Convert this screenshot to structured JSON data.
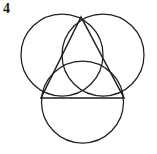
{
  "figure": {
    "label": "4",
    "background_color": "#ffffff",
    "stroke_color": "#1e1e1e",
    "canvas": {
      "width": 157,
      "height": 154
    },
    "circles": [
      {
        "name": "upper-left-circle",
        "cx": 62,
        "cy": 55,
        "r": 41
      },
      {
        "name": "upper-right-circle",
        "cx": 103,
        "cy": 55,
        "r": 41
      },
      {
        "name": "lower-circle",
        "cx": 82.5,
        "cy": 102,
        "r": 41
      }
    ],
    "triangle": {
      "name": "inscribed-triangle",
      "points": "81,17 41,98 124,98",
      "vertices": [
        {
          "name": "apex-vertex",
          "x": 81,
          "y": 17
        },
        {
          "name": "left-base-vertex",
          "x": 41,
          "y": 98
        },
        {
          "name": "right-base-vertex",
          "x": 124,
          "y": 98
        }
      ]
    }
  }
}
